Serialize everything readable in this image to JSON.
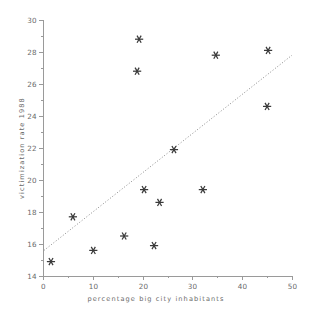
{
  "chart_data": {
    "type": "scatter",
    "title": "",
    "subtitle": "",
    "xlabel": "percentage big city inhabitants",
    "ylabel": "victimization rate 1988",
    "xlim": [
      0,
      50
    ],
    "ylim": [
      14,
      30
    ],
    "xticks": [
      0,
      10,
      20,
      30,
      40,
      50
    ],
    "yticks": [
      14,
      16,
      18,
      20,
      22,
      24,
      26,
      28,
      30
    ],
    "xtick_labels": [
      "0",
      "10",
      "20",
      "30",
      "40",
      "50"
    ],
    "ytick_labels": [
      "14",
      "16",
      "18",
      "20",
      "22",
      "24",
      "26",
      "28",
      "30"
    ],
    "xminor_ticks": [
      5,
      15,
      25,
      35,
      45
    ],
    "yminor_ticks": [
      15,
      17,
      19,
      21,
      23,
      25,
      27,
      29
    ],
    "grid": false,
    "legend": null,
    "marker": "asterisk",
    "marker_color": "#3a3a3a",
    "frame_color": "#9a9a9a",
    "points": [
      {
        "x": 1.6,
        "y": 14.9
      },
      {
        "x": 6.0,
        "y": 17.7
      },
      {
        "x": 10.1,
        "y": 15.6
      },
      {
        "x": 16.3,
        "y": 16.5
      },
      {
        "x": 18.9,
        "y": 26.8
      },
      {
        "x": 19.3,
        "y": 28.8
      },
      {
        "x": 20.3,
        "y": 19.4
      },
      {
        "x": 22.3,
        "y": 15.9
      },
      {
        "x": 23.4,
        "y": 18.6
      },
      {
        "x": 26.3,
        "y": 21.9
      },
      {
        "x": 32.1,
        "y": 19.4
      },
      {
        "x": 34.7,
        "y": 27.8
      },
      {
        "x": 45.0,
        "y": 24.6
      },
      {
        "x": 45.2,
        "y": 28.1
      }
    ],
    "trendline": {
      "style": "dotted",
      "color": "#8a8a8a",
      "x_start": 0.2,
      "y_start": 15.6,
      "x_end": 50.0,
      "y_end": 27.8
    }
  }
}
